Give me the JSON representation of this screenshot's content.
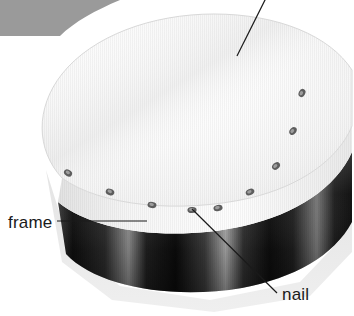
{
  "figure": {
    "background_color": "#ffffff",
    "corner_block_color": "#9a9a9a",
    "drumhead_color": "#fbfbfb",
    "rim_color": "#f2f2f2",
    "frame_dark_color": "#141414",
    "frame_highlight_color": "#b4b4b4",
    "shadow_color": "#e8e8e8",
    "nail_color": "#5d5d5d",
    "leader_color": "#1a1a1a"
  },
  "labels": [
    {
      "id": "frame",
      "text": "frame",
      "text_x": 8,
      "text_y": 228,
      "leader": "M 57 221 L 147 221",
      "interactable": false
    },
    {
      "id": "nail",
      "text": "nail",
      "text_x": 282,
      "text_y": 300,
      "leader": "M 192 209 L 277 293",
      "interactable": false
    },
    {
      "id": "head",
      "text": "",
      "text_x": 0,
      "text_y": 0,
      "leader": "M 266 -2 L 237 56",
      "interactable": false
    }
  ],
  "nails": [
    {
      "cx": 302,
      "cy": 93,
      "rx": 4.2,
      "ry": 3.2,
      "angle": -62
    },
    {
      "cx": 293,
      "cy": 131,
      "rx": 4.3,
      "ry": 3.2,
      "angle": -52
    },
    {
      "cx": 276,
      "cy": 166,
      "rx": 4.4,
      "ry": 3.2,
      "angle": -40
    },
    {
      "cx": 250,
      "cy": 192,
      "rx": 4.5,
      "ry": 3.1,
      "angle": -26
    },
    {
      "cx": 218,
      "cy": 208,
      "rx": 4.6,
      "ry": 3.1,
      "angle": -13
    },
    {
      "cx": 192,
      "cy": 210,
      "rx": 4.6,
      "ry": 3.1,
      "angle": -4
    },
    {
      "cx": 152,
      "cy": 205,
      "rx": 4.5,
      "ry": 3.1,
      "angle": 10
    },
    {
      "cx": 110,
      "cy": 192,
      "rx": 4.4,
      "ry": 3.2,
      "angle": 20
    },
    {
      "cx": 68,
      "cy": 173,
      "rx": 4.3,
      "ry": 3.2,
      "angle": 30
    }
  ],
  "geometry": {
    "head_path": "M 62 178 C 36 150 35 108 62 74 C 92 36 152 14 214 14 C 278 14 330 36 352 70 L 352 126 C 338 160 300 186 250 198 C 180 214 100 206 62 178 Z",
    "rim_path": "M 62 178 C 100 206 180 214 250 198 C 300 186 338 160 352 126 L 352 152 C 336 188 296 214 244 226 C 172 242 94 232 58 202 Z",
    "frame_path": "M 58 202 C 94 232 172 242 244 226 C 296 214 336 188 352 152 L 352 222 C 334 256 294 278 242 288 C 170 300 96 286 66 254 Z",
    "shadow_path": "M 46 170 L 70 246 L 120 286 L 210 300 L 300 282 L 340 240 L 352 196 L 352 252 L 310 296 L 214 312 L 112 300 L 62 262 Z"
  }
}
